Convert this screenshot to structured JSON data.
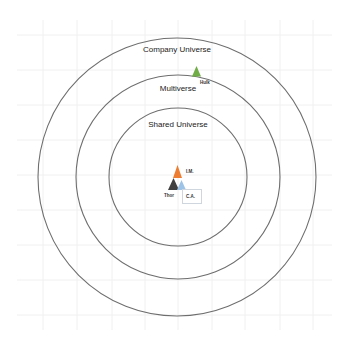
{
  "diagram": {
    "colors": {
      "background": "#ffffff",
      "grid": "#f0f0f0",
      "circle_stroke": "#6e6e6e",
      "hulk": "#70ad47",
      "iron_man": "#ed7d31",
      "thor": "#404040",
      "captain_america": "#9dc3e6"
    },
    "circles": [
      {
        "id": "company-universe",
        "label": "Company Universe",
        "cx": 177,
        "cy": 177,
        "r": 139
      },
      {
        "id": "multiverse",
        "label": "Multiverse",
        "cx": 178,
        "cy": 177,
        "r": 102
      },
      {
        "id": "shared-universe",
        "label": "Shared Universe",
        "cx": 178,
        "cy": 177,
        "r": 69
      }
    ],
    "characters": [
      {
        "id": "hulk",
        "label": "Hulk",
        "color": "#70ad47"
      },
      {
        "id": "iron-man",
        "label": "I.M.",
        "color": "#ed7d31"
      },
      {
        "id": "thor",
        "label": "Thor",
        "color": "#404040"
      },
      {
        "id": "captain-america",
        "label": "C.A.",
        "color": "#9dc3e6"
      }
    ]
  }
}
